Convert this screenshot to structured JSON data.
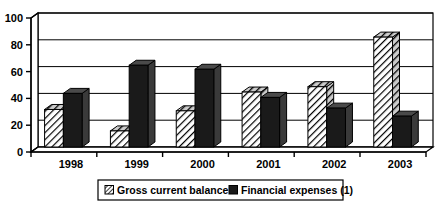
{
  "chart_data": {
    "type": "bar",
    "title": "",
    "subtitle": "",
    "xlabel": "",
    "ylabel": "",
    "categories": [
      "1998",
      "1999",
      "2000",
      "2001",
      "2002",
      "2003"
    ],
    "series": [
      {
        "name": "Gross current balance",
        "pattern": "diagonal-hatch",
        "color": "#ffffff",
        "values": [
          28,
          12,
          27,
          41,
          45,
          82
        ]
      },
      {
        "name": "Financial expenses (1)",
        "pattern": "solid",
        "color": "#1a1a1a",
        "values": [
          40,
          61,
          58,
          37,
          29,
          23
        ]
      }
    ],
    "ylim": [
      0,
      100
    ],
    "yticks": [
      0,
      20,
      40,
      60,
      80,
      100
    ],
    "ytick_labels": [
      "0",
      "20",
      "40",
      "60",
      "80",
      "100"
    ],
    "grid": true,
    "grid_axis": "y",
    "legend_position": "bottom",
    "style": "3d-bar-monochrome"
  },
  "legend": {
    "items": [
      {
        "label": "Gross current balance",
        "swatch": "hatched-swatch"
      },
      {
        "label": "Financial expenses (1)",
        "swatch": "solid-swatch"
      }
    ]
  },
  "colors": {
    "axis": "#000000",
    "grid": "#000000",
    "background": "#ffffff",
    "series_one_fill": "#ffffff",
    "series_two_fill": "#1a1a1a",
    "series_side_shade": "#555555"
  }
}
